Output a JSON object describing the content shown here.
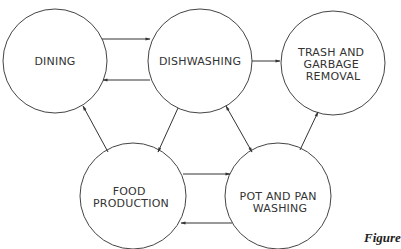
{
  "diagram": {
    "nodes": [
      {
        "id": "dining",
        "lines": [
          "DINING"
        ]
      },
      {
        "id": "dishwashing",
        "lines": [
          "DISHWASHING"
        ]
      },
      {
        "id": "trash",
        "lines": [
          "TRASH AND",
          "GARBAGE",
          "REMOVAL"
        ]
      },
      {
        "id": "food",
        "lines": [
          "FOOD",
          "PRODUCTION"
        ]
      },
      {
        "id": "pot",
        "lines": [
          "POT AND PAN",
          "WASHING"
        ]
      }
    ],
    "edges": [
      {
        "from": "dining",
        "to": "dishwashing"
      },
      {
        "from": "dishwashing",
        "to": "dining"
      },
      {
        "from": "dishwashing",
        "to": "trash"
      },
      {
        "from": "dishwashing",
        "to": "food"
      },
      {
        "from": "food",
        "to": "dining"
      },
      {
        "from": "dishwashing",
        "to": "pot",
        "bidirectional": true
      },
      {
        "from": "pot",
        "to": "trash"
      },
      {
        "from": "food",
        "to": "pot"
      },
      {
        "from": "pot",
        "to": "food"
      }
    ],
    "caption": "Figure"
  }
}
